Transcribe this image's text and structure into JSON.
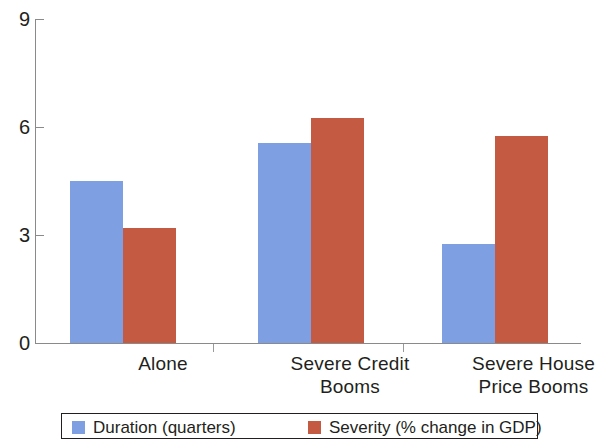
{
  "chart_data": {
    "type": "bar",
    "title": "",
    "subtitle": "",
    "xlabel": "",
    "ylabel": "",
    "ylim": [
      0,
      9
    ],
    "yticks": [
      0,
      3,
      6,
      9
    ],
    "grid": false,
    "legend_position": "bottom",
    "categories": [
      "Alone",
      "Severe Credit\nBooms",
      "Severe House\nPrice Booms"
    ],
    "category_lines": [
      [
        "Alone"
      ],
      [
        "Severe Credit",
        "Booms"
      ],
      [
        "Severe House",
        "Price Booms"
      ]
    ],
    "series": [
      {
        "name": "Duration (quarters)",
        "color": "#7e9fe2",
        "values": [
          4.5,
          5.55,
          2.75
        ]
      },
      {
        "name": "Severity (% change in GDP)",
        "color": "#c35a41",
        "values": [
          3.2,
          6.25,
          5.75
        ]
      }
    ]
  },
  "axis": {
    "y_tick_labels": [
      "0",
      "3",
      "6",
      "9"
    ]
  },
  "legend": {
    "entries": [
      {
        "label": "Duration (quarters)",
        "color": "#7e9fe2"
      },
      {
        "label": "Severity (% change in GDP)",
        "color": "#c35a41"
      }
    ]
  },
  "colors": {
    "series_blue": "#7e9fe2",
    "series_red": "#c35a41",
    "axis": "#8a8a8a",
    "text": "#231f20",
    "background": "#ffffff"
  }
}
